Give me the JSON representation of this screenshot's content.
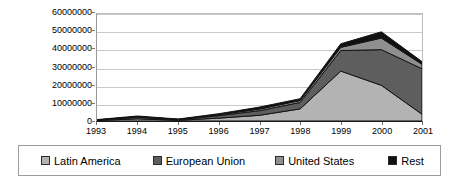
{
  "chart_data": {
    "type": "area",
    "stacked": true,
    "title": "",
    "subtitle": "",
    "xlabel": "",
    "ylabel": "",
    "categories": [
      "1993",
      "1994",
      "1995",
      "1996",
      "1997",
      "1998",
      "1999",
      "2000",
      "2001"
    ],
    "series": [
      {
        "name": "Latin America",
        "color": "#b3b3b3",
        "values": [
          300000,
          1200000,
          400000,
          1600000,
          3200000,
          6800000,
          28000000,
          20000000,
          3800000
        ]
      },
      {
        "name": "European Union",
        "color": "#5e5e5e",
        "values": [
          200000,
          900000,
          300000,
          1400000,
          2600000,
          3600000,
          11500000,
          20000000,
          25500000
        ]
      },
      {
        "name": "United States",
        "color": "#8f8f8f",
        "values": [
          100000,
          300000,
          200000,
          500000,
          900000,
          1100000,
          1800000,
          6500000,
          2500000
        ]
      },
      {
        "name": "Rest",
        "color": "#111111",
        "values": [
          200000,
          400000,
          200000,
          600000,
          1100000,
          1000000,
          2000000,
          3500000,
          1500000
        ]
      }
    ],
    "totals": [
      800000,
      2800000,
      1100000,
      4100000,
      7800000,
      12500000,
      43300000,
      50000000,
      33300000
    ],
    "ylim": [
      0,
      60000000
    ],
    "yticks": [
      0,
      10000000,
      20000000,
      30000000,
      40000000,
      50000000,
      60000000
    ],
    "ytick_labels": [
      "0",
      "10000000",
      "20000000",
      "30000000",
      "40000000",
      "50000000",
      "60000000"
    ],
    "grid": true,
    "legend_position": "bottom"
  },
  "legend": {
    "items": [
      {
        "label": "Latin America",
        "swatch": "#b3b3b3",
        "swatch_name": "legend-swatch-latin-america"
      },
      {
        "label": "European Union",
        "swatch": "#5e5e5e",
        "swatch_name": "legend-swatch-european-union"
      },
      {
        "label": "United States",
        "swatch": "#8f8f8f",
        "swatch_name": "legend-swatch-united-states"
      },
      {
        "label": "Rest",
        "swatch": "#111111",
        "swatch_name": "legend-swatch-rest"
      }
    ]
  }
}
